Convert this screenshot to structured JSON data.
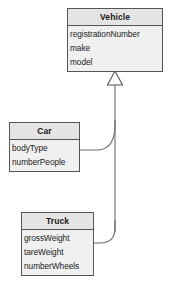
{
  "diagram": {
    "type": "uml-class-diagram",
    "background_color": "#ffffff",
    "border_color": "#555555",
    "header_color": "#e4e4e4",
    "body_color": "#f0f0f0",
    "text_color": "#1a1a1a",
    "classes": [
      {
        "id": "vehicle",
        "name": "Vehicle",
        "attributes": [
          "registrationNumber",
          "make",
          "model"
        ]
      },
      {
        "id": "car",
        "name": "Car",
        "attributes": [
          "bodyType",
          "numberPeople"
        ]
      },
      {
        "id": "truck",
        "name": "Truck",
        "attributes": [
          "grossWeight",
          "tareWeight",
          "numberWheels"
        ]
      }
    ],
    "relationships": [
      {
        "type": "generalization",
        "from": "Car",
        "to": "Vehicle",
        "arrowhead": "hollow-triangle"
      },
      {
        "type": "generalization",
        "from": "Truck",
        "to": "Vehicle",
        "arrowhead": "hollow-triangle"
      }
    ]
  }
}
